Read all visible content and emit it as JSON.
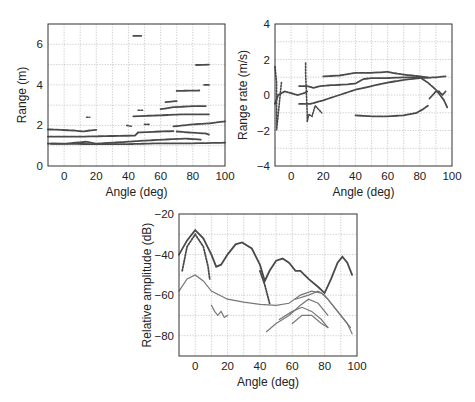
{
  "chart_data": [
    {
      "id": "range",
      "type": "scatter",
      "title": "",
      "xlabel": "Angle (deg)",
      "ylabel": "Range (m)",
      "xlim": [
        -10,
        100
      ],
      "ylim": [
        0,
        7
      ],
      "xticks": [
        0,
        20,
        40,
        60,
        80,
        100
      ],
      "yticks": [
        0,
        2,
        4,
        6
      ],
      "xgrid": [
        0,
        10,
        20,
        30,
        40,
        50,
        60,
        70,
        80,
        90
      ],
      "ygrid": [
        1,
        2,
        3,
        4,
        5,
        6
      ],
      "grid": true,
      "series": [
        {
          "name": "track-1.45m",
          "points": [
            [
              -10,
              1.45
            ],
            [
              10,
              1.45
            ],
            [
              30,
              1.48
            ],
            [
              44,
              1.5
            ],
            [
              46,
              1.65
            ],
            [
              60,
              1.7
            ],
            [
              68,
              1.72
            ]
          ]
        },
        {
          "name": "track-1.1m",
          "points": [
            [
              -10,
              1.1
            ],
            [
              20,
              1.08
            ],
            [
              40,
              1.08
            ],
            [
              60,
              1.12
            ],
            [
              80,
              1.12
            ],
            [
              100,
              1.15
            ]
          ]
        },
        {
          "name": "track-1.2m",
          "points": [
            [
              -8,
              1.1
            ],
            [
              0,
              1.1
            ],
            [
              14,
              1.2
            ],
            [
              20,
              1.1
            ],
            [
              40,
              1.2
            ],
            [
              50,
              1.25
            ],
            [
              62,
              1.3
            ],
            [
              75,
              1.35
            ],
            [
              85,
              1.3
            ]
          ]
        },
        {
          "name": "track-2m-rising",
          "points": [
            [
              68,
              1.95
            ],
            [
              80,
              2.05
            ],
            [
              90,
              2.1
            ],
            [
              100,
              2.2
            ]
          ]
        },
        {
          "name": "track-2.5m",
          "points": [
            [
              43,
              2.45
            ],
            [
              60,
              2.5
            ],
            [
              75,
              2.55
            ],
            [
              90,
              2.55
            ]
          ]
        },
        {
          "name": "track-2.9m",
          "points": [
            [
              60,
              2.8
            ],
            [
              68,
              2.9
            ],
            [
              80,
              2.95
            ],
            [
              88,
              2.95
            ]
          ]
        },
        {
          "name": "track-3.2m",
          "points": [
            [
              63,
              3.15
            ],
            [
              70,
              3.2
            ]
          ]
        },
        {
          "name": "track-3.7m",
          "points": [
            [
              70,
              3.7
            ],
            [
              84,
              3.72
            ]
          ]
        },
        {
          "name": "track-4m",
          "points": [
            [
              87,
              4.0
            ],
            [
              90,
              4.0
            ]
          ]
        },
        {
          "name": "track-5m",
          "points": [
            [
              82,
              4.98
            ],
            [
              90,
              5.0
            ]
          ]
        },
        {
          "name": "track-6.4m",
          "points": [
            [
              43,
              6.42
            ],
            [
              48,
              6.42
            ]
          ]
        },
        {
          "name": "track-1.75m",
          "points": [
            [
              -10,
              1.8
            ],
            [
              -8,
              1.8
            ],
            [
              6,
              1.75
            ],
            [
              12,
              1.7
            ],
            [
              16,
              1.75
            ],
            [
              20,
              1.78
            ]
          ]
        },
        {
          "name": "track-1.6m-lower",
          "points": [
            [
              70,
              1.7
            ],
            [
              78,
              1.65
            ],
            [
              88,
              1.6
            ],
            [
              90,
              1.55
            ]
          ]
        },
        {
          "name": "blip-2.4m",
          "points": [
            [
              14,
              2.4
            ],
            [
              16,
              2.4
            ]
          ]
        },
        {
          "name": "blip-2m",
          "points": [
            [
              39,
              2.0
            ],
            [
              42,
              1.95
            ]
          ]
        },
        {
          "name": "blip-2.8m",
          "points": [
            [
              46,
              2.75
            ],
            [
              49,
              2.75
            ]
          ]
        },
        {
          "name": "blip-2.05m",
          "points": [
            [
              50,
              2.05
            ],
            [
              53,
              2.05
            ]
          ]
        }
      ]
    },
    {
      "id": "range-rate",
      "type": "scatter",
      "title": "",
      "xlabel": "Angle (deg)",
      "ylabel": "Range rate (m/s)",
      "xlim": [
        -10,
        100
      ],
      "ylim": [
        -4,
        4
      ],
      "xticks": [
        0,
        20,
        40,
        60,
        80,
        100
      ],
      "yticks": [
        -4,
        -2,
        0,
        2,
        4
      ],
      "xgrid": [
        0,
        10,
        20,
        30,
        40,
        50,
        60,
        70,
        80,
        90
      ],
      "ygrid": [
        -3,
        -2,
        -1,
        0,
        1,
        2,
        3
      ],
      "grid": true,
      "series": [
        {
          "name": "loop-left",
          "points": [
            [
              -10,
              -0.5
            ],
            [
              -8,
              0.0
            ],
            [
              -4,
              0.2
            ],
            [
              0,
              0.1
            ],
            [
              4,
              0.0
            ],
            [
              8,
              0.1
            ],
            [
              10,
              0.2
            ]
          ]
        },
        {
          "name": "track-rising-low",
          "points": [
            [
              5,
              -0.5
            ],
            [
              12,
              -0.5
            ],
            [
              20,
              -0.3
            ],
            [
              30,
              0.0
            ],
            [
              40,
              0.3
            ],
            [
              50,
              0.5
            ],
            [
              60,
              0.7
            ],
            [
              70,
              0.85
            ],
            [
              80,
              0.95
            ],
            [
              90,
              1.0
            ],
            [
              96,
              1.05
            ]
          ]
        },
        {
          "name": "track-main-upper",
          "points": [
            [
              5,
              0.5
            ],
            [
              10,
              0.5
            ],
            [
              14,
              0.4
            ],
            [
              18,
              0.5
            ],
            [
              25,
              0.55
            ],
            [
              35,
              0.6
            ],
            [
              40,
              0.65
            ],
            [
              45,
              0.9
            ],
            [
              50,
              0.95
            ],
            [
              60,
              0.95
            ],
            [
              70,
              1.0
            ],
            [
              80,
              1.0
            ],
            [
              85,
              0.7
            ],
            [
              90,
              0.3
            ],
            [
              95,
              -0.3
            ],
            [
              97,
              -0.7
            ]
          ]
        },
        {
          "name": "track-1.2",
          "points": [
            [
              20,
              1.05
            ],
            [
              30,
              1.1
            ],
            [
              40,
              1.25
            ],
            [
              50,
              1.25
            ],
            [
              60,
              1.3
            ],
            [
              66,
              1.2
            ],
            [
              75,
              1.1
            ],
            [
              85,
              1.0
            ]
          ]
        },
        {
          "name": "track-negative",
          "points": [
            [
              40,
              -1.15
            ],
            [
              50,
              -1.2
            ],
            [
              60,
              -1.2
            ],
            [
              70,
              -1.15
            ],
            [
              78,
              -1.0
            ],
            [
              82,
              -0.8
            ],
            [
              85,
              -0.6
            ]
          ]
        },
        {
          "name": "scatter-10deg",
          "points": [
            [
              9,
              1.8
            ],
            [
              9,
              1.2
            ],
            [
              10,
              -1.0
            ],
            [
              10,
              -1.5
            ],
            [
              11,
              -1.1
            ],
            [
              13,
              -1.2
            ],
            [
              15,
              -0.6
            ],
            [
              17,
              -0.8
            ],
            [
              19,
              -1.0
            ]
          ]
        },
        {
          "name": "blips-left",
          "points": [
            [
              -10,
              1.6
            ],
            [
              -9,
              0.7
            ],
            [
              -9,
              -1.5
            ],
            [
              -9,
              -2.0
            ],
            [
              -6,
              0.7
            ]
          ]
        },
        {
          "name": "loop-right",
          "points": [
            [
              86,
              -0.2
            ],
            [
              88,
              0.0
            ],
            [
              90,
              0.2
            ],
            [
              92,
              0.2
            ],
            [
              94,
              0.0
            ],
            [
              96,
              0.2
            ]
          ]
        }
      ]
    },
    {
      "id": "amplitude",
      "type": "line",
      "title": "",
      "xlabel": "Angle (deg)",
      "ylabel": "Relative amplitude (dB)",
      "xlim": [
        -10,
        100
      ],
      "ylim": [
        -90,
        -20
      ],
      "xticks": [
        0,
        20,
        40,
        60,
        80,
        100
      ],
      "yticks": [
        -20,
        -40,
        -60,
        -80
      ],
      "xgrid": [
        0,
        10,
        20,
        30,
        40,
        50,
        60,
        70,
        80,
        90
      ],
      "ygrid": [
        -30,
        -40,
        -50,
        -60,
        -70,
        -80
      ],
      "grid": true,
      "series": [
        {
          "name": "main-lobes",
          "points": [
            [
              -10,
              -40
            ],
            [
              -5,
              -33
            ],
            [
              0,
              -28
            ],
            [
              5,
              -32
            ],
            [
              10,
              -40
            ],
            [
              13,
              -46
            ],
            [
              16,
              -45
            ],
            [
              20,
              -40
            ],
            [
              25,
              -35
            ],
            [
              29,
              -34
            ],
            [
              35,
              -37
            ],
            [
              40,
              -45
            ],
            [
              43,
              -53
            ],
            [
              46,
              -48
            ],
            [
              50,
              -43
            ],
            [
              54,
              -42
            ],
            [
              58,
              -44
            ],
            [
              62,
              -48
            ],
            [
              65,
              -48
            ],
            [
              70,
              -52
            ],
            [
              76,
              -56
            ],
            [
              80,
              -59
            ],
            [
              84,
              -52
            ],
            [
              88,
              -44
            ],
            [
              91,
              -41
            ],
            [
              94,
              -44
            ],
            [
              97,
              -50
            ]
          ]
        },
        {
          "name": "secondary-lobe",
          "points": [
            [
              -10,
              -58
            ],
            [
              -5,
              -52
            ],
            [
              0,
              -50
            ],
            [
              5,
              -53
            ],
            [
              10,
              -58
            ],
            [
              20,
              -62
            ],
            [
              30,
              -63.5
            ],
            [
              40,
              -64.5
            ],
            [
              50,
              -65
            ],
            [
              58,
              -64
            ],
            [
              65,
              -60
            ],
            [
              72,
              -58
            ],
            [
              78,
              -59
            ],
            [
              82,
              -62
            ],
            [
              88,
              -68
            ],
            [
              94,
              -74
            ],
            [
              97,
              -79
            ]
          ]
        },
        {
          "name": "dotted-falloff-left",
          "points": [
            [
              -8,
              -48
            ],
            [
              -5,
              -36
            ],
            [
              0,
              -30
            ],
            [
              5,
              -36
            ],
            [
              8,
              -46
            ],
            [
              9,
              -52
            ]
          ]
        },
        {
          "name": "dotted-falloff-mid",
          "points": [
            [
              40,
              -48
            ],
            [
              43,
              -55
            ],
            [
              46,
              -64
            ]
          ]
        },
        {
          "name": "cluster-15deg",
          "points": [
            [
              10,
              -65
            ],
            [
              12,
              -68
            ],
            [
              14,
              -70
            ],
            [
              16,
              -68
            ],
            [
              18,
              -71
            ],
            [
              20,
              -70
            ]
          ]
        },
        {
          "name": "cluster-70deg-a",
          "points": [
            [
              44,
              -78
            ],
            [
              50,
              -74
            ],
            [
              58,
              -70
            ],
            [
              65,
              -65
            ],
            [
              70,
              -62
            ],
            [
              76,
              -64
            ],
            [
              82,
              -70
            ]
          ]
        },
        {
          "name": "cluster-70deg-b",
          "points": [
            [
              52,
              -72
            ],
            [
              60,
              -68
            ],
            [
              66,
              -66
            ],
            [
              72,
              -68
            ],
            [
              78,
              -72
            ],
            [
              82,
              -76
            ]
          ]
        },
        {
          "name": "cluster-70deg-c",
          "points": [
            [
              60,
              -74
            ],
            [
              66,
              -70
            ],
            [
              72,
              -70
            ],
            [
              78,
              -74
            ],
            [
              82,
              -76
            ]
          ]
        },
        {
          "name": "crossing-lines",
          "points": [
            [
              62,
              -62
            ],
            [
              70,
              -60
            ],
            [
              76,
              -58
            ],
            [
              80,
              -60
            ],
            [
              86,
              -66
            ],
            [
              92,
              -72
            ],
            [
              96,
              -76
            ]
          ]
        }
      ]
    }
  ]
}
